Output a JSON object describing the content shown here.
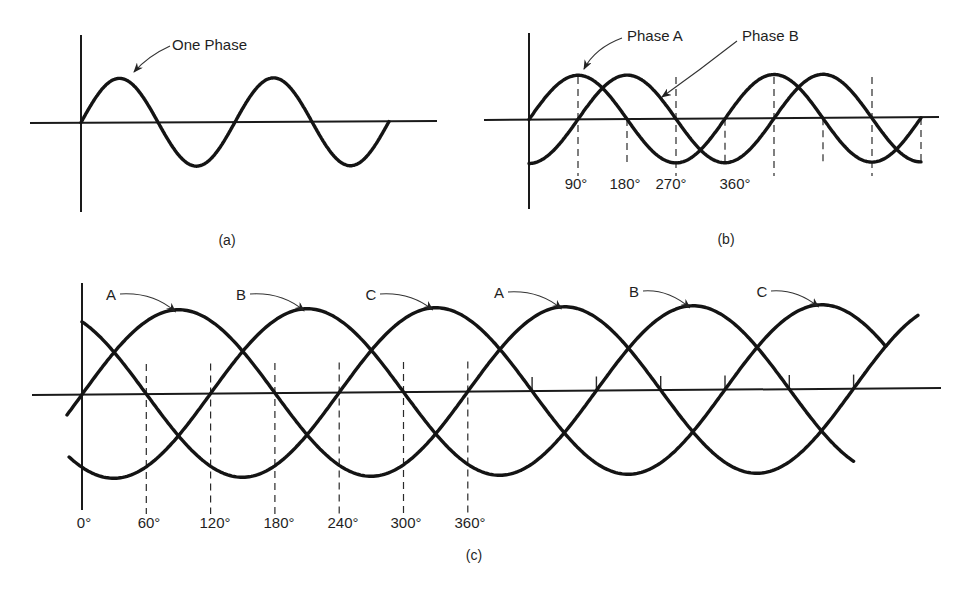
{
  "panels": {
    "a": {
      "caption": "(a)",
      "label": "One Phase"
    },
    "b": {
      "caption": "(b)",
      "labels": [
        "Phase A",
        "Phase B"
      ],
      "degree_labels": [
        "90°",
        "180°",
        "270°",
        "360°"
      ]
    },
    "c": {
      "caption": "(c)",
      "peak_labels": [
        "A",
        "B",
        "C",
        "A",
        "B",
        "C"
      ],
      "degree_labels": [
        "0°",
        "60°",
        "120°",
        "180°",
        "240°",
        "300°",
        "360°"
      ]
    }
  },
  "chart_data": [
    {
      "type": "line",
      "title": "(a) Single-phase AC waveform",
      "annotations": [
        "One Phase"
      ],
      "series": [
        {
          "name": "One Phase",
          "phase_deg": 0,
          "cycles": 2
        }
      ],
      "x_range_deg": [
        0,
        720
      ]
    },
    {
      "type": "line",
      "title": "(b) Two-phase AC waveform",
      "annotations": [
        "Phase A",
        "Phase B"
      ],
      "xticks": [
        "90°",
        "180°",
        "270°",
        "360°"
      ],
      "series": [
        {
          "name": "Phase A",
          "phase_deg": 0
        },
        {
          "name": "Phase B",
          "phase_deg": -90
        }
      ],
      "x_range_deg": [
        0,
        720
      ]
    },
    {
      "type": "line",
      "title": "(c) Three-phase AC waveform",
      "annotations": [
        "A",
        "B",
        "C",
        "A",
        "B",
        "C"
      ],
      "xticks": [
        "0°",
        "60°",
        "120°",
        "180°",
        "240°",
        "300°",
        "360°"
      ],
      "series": [
        {
          "name": "A",
          "phase_deg": 0,
          "x_range_deg": [
            -14,
            780
          ]
        },
        {
          "name": "B",
          "phase_deg": -120,
          "x_range_deg": [
            -12,
            720
          ]
        },
        {
          "name": "C",
          "phase_deg": -240,
          "x_range_deg": [
            0,
            750
          ]
        }
      ]
    }
  ]
}
